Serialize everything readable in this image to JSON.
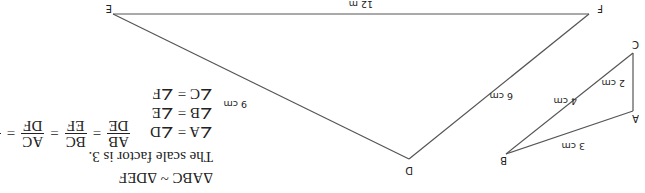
{
  "triangle_abc": {
    "vertices": {
      "A": "A",
      "B": "B",
      "C": "C"
    },
    "sides": {
      "ab": "3 cm",
      "bc": "4 cm",
      "ac": "2 cm"
    }
  },
  "triangle_def": {
    "vertices": {
      "D": "D",
      "E": "E",
      "F": "F"
    },
    "sides": {
      "de": "9 cm",
      "ef": "12 m",
      "df": "6 cm"
    }
  },
  "statements": {
    "similarity": "ΔABC ~ ΔDEF",
    "scale_factor": "The scale factor is 3.",
    "angle_a": "∠A = ∠D",
    "angle_b": "∠B = ∠E",
    "angle_c": "∠C = ∠F",
    "ratios": {
      "ab": "AB",
      "de": "DE",
      "bc": "BC",
      "ef": "EF",
      "ac": "AC",
      "df": "DF",
      "one": "1",
      "three": "3",
      "eq": "="
    }
  }
}
